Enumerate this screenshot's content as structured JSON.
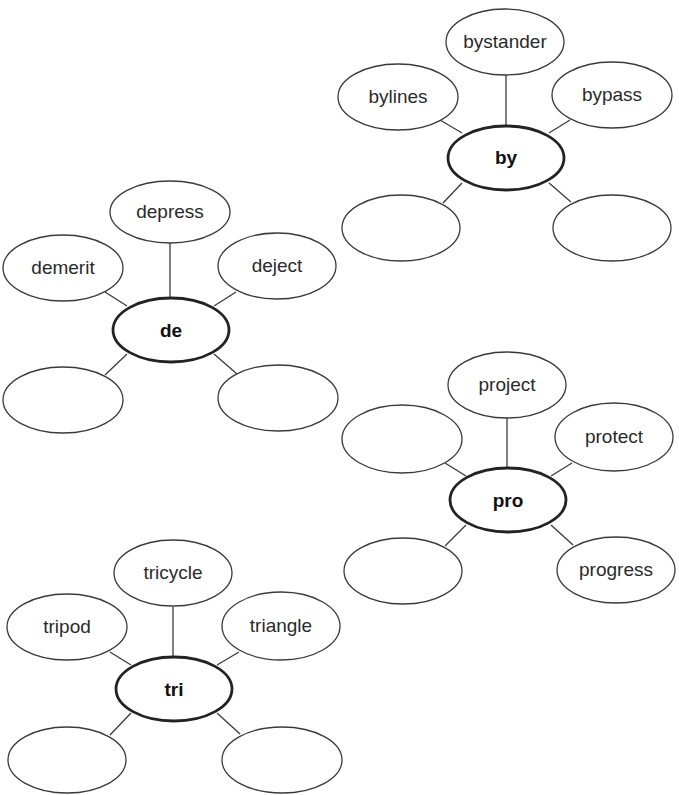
{
  "diagram": {
    "type": "word-web",
    "clusters": [
      {
        "root": "by",
        "top": "bystander",
        "left": "bylines",
        "right": "bypass",
        "bottom_left": "",
        "bottom_right": ""
      },
      {
        "root": "de",
        "top": "depress",
        "left": "demerit",
        "right": "deject",
        "bottom_left": "",
        "bottom_right": ""
      },
      {
        "root": "pro",
        "top": "project",
        "left": "",
        "right": "protect",
        "bottom_left": "",
        "bottom_right": "progress"
      },
      {
        "root": "tri",
        "top": "tricycle",
        "left": "tripod",
        "right": "triangle",
        "bottom_left": "",
        "bottom_right": ""
      }
    ]
  }
}
